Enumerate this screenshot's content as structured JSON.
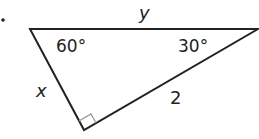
{
  "diagram": {
    "type": "right-triangle",
    "bullet": "•",
    "angles": {
      "top_left": "60°",
      "top_right": "30°",
      "bottom": "right-angle"
    },
    "sides": {
      "top": "y",
      "left": "x",
      "right": "2"
    },
    "colors": {
      "line": "#222222",
      "right_angle_marker": "#999999"
    }
  }
}
